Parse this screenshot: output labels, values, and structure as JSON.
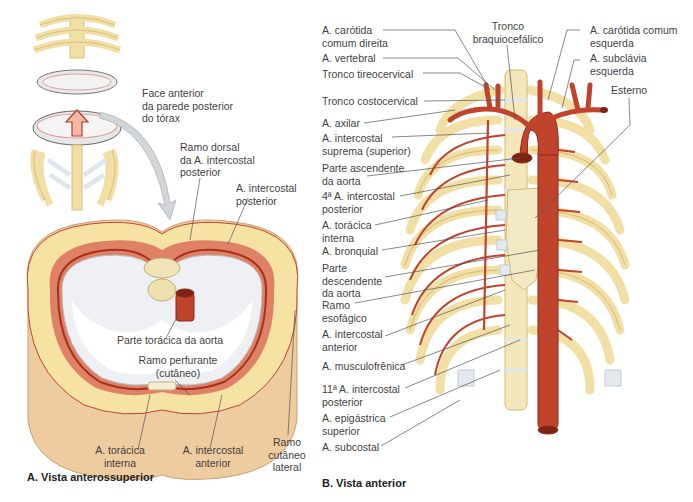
{
  "panel_a": {
    "caption": "A. Vista anterossuperior",
    "labels": {
      "face_anterior": "Face anterior\nda parede posterior\ndo tórax",
      "ramo_dorsal": "Ramo dorsal\nda A. intercostal\nposterior",
      "a_intercostal_posterior": "A. intercostal\nposterior",
      "parte_toracica_aorta": "Parte torácica da aorta",
      "ramo_perfurante": "Ramo perfurante\n(cutâneo)",
      "a_toracica_interna": "A. torácica\ninterna",
      "a_intercostal_anterior": "A. intercostal\nanterior",
      "ramo_cutaneo_lateral": "Ramo\ncutâneo\nlateral"
    }
  },
  "panel_b": {
    "caption": "B. Vista anterior",
    "left_labels": [
      "A. carótida\ncomum direita",
      "A. vertebral",
      "Tronco tireocervical",
      "Tronco costocervical",
      "A. axilar",
      "A. intercostal\nsuprema (superior)",
      "Parte ascendente\nda aorta",
      "4ª A. intercostal\nposterior",
      "A. torácica\ninterna",
      "A. bronquial",
      "Parte\ndescendente\nda aorta",
      "Ramo\nesofágico",
      "A. intercostal\nanterior",
      "A. musculofrênica",
      "11ª A. intercostal\nposterior",
      "A. epigástrica\nsuperior",
      "A. subcostal"
    ],
    "top_labels": {
      "tronco_braquiocefalico": "Tronco\nbraquiocefálico",
      "carotida_esquerda": "A. carótida comum\nesquerda",
      "subclavia_esquerda": "A. subclávia\nesquerda",
      "esterno": "Esterno"
    }
  },
  "colors": {
    "artery": "#c0432b",
    "artery_dark": "#9e2f1c",
    "bone": "#f1dfa6",
    "bone_shade": "#d9bf7a",
    "cartilage": "#dfe6ee",
    "muscle": "#d9705a",
    "fat": "#f6e3a3",
    "skin": "#f0cfa6",
    "leader": "#555555",
    "arrow": "#c9cdd1"
  }
}
